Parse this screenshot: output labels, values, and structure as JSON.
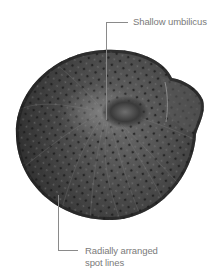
{
  "figure": {
    "colors": {
      "background": "#ffffff",
      "shell_dark": "#2a2a2a",
      "shell_mid": "#4a4a4a",
      "shell_light": "#7a7a7a",
      "leader_line": "#8a8a8a",
      "label_text": "#7a7a7a"
    }
  },
  "annotations": [
    {
      "id": "umbilicus",
      "text": "Shallow umbilicus"
    },
    {
      "id": "spot-lines",
      "line1": "Radially arranged",
      "line2": "spot lines"
    }
  ]
}
